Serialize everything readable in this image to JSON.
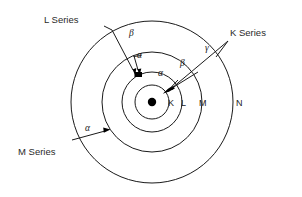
{
  "figure": {
    "background_color": "#ffffff",
    "stroke_color": "#1a1a1a"
  },
  "nucleus": {
    "label": "nucleus",
    "cx": 152,
    "cy": 102,
    "r": 4.2,
    "color": "#000000"
  },
  "shells": [
    {
      "name": "K",
      "label": "K",
      "r": 17,
      "label_x": 168,
      "label_y": 106
    },
    {
      "name": "L",
      "label": "L",
      "r": 30,
      "label_x": 181,
      "label_y": 106
    },
    {
      "name": "M",
      "label": "M",
      "r": 50,
      "label_x": 199,
      "label_y": 106
    },
    {
      "name": "N",
      "label": "N",
      "r": 81,
      "label_x": 236,
      "label_y": 106
    }
  ],
  "series": [
    {
      "id": "k-series",
      "label": "K Series",
      "label_x": 230,
      "label_y": 36,
      "transitions": [
        {
          "greek": "α",
          "greek_x": 158,
          "greek_y": 76
        },
        {
          "greek": "β",
          "greek_x": 180,
          "greek_y": 66
        },
        {
          "greek": "γ",
          "greek_x": 205,
          "greek_y": 51
        }
      ]
    },
    {
      "id": "l-series",
      "label": "L Series",
      "label_x": 44,
      "label_y": 23,
      "transitions": [
        {
          "greek": "α",
          "greek_x": 137,
          "greek_y": 58
        },
        {
          "greek": "β",
          "greek_x": 129,
          "greek_y": 36
        }
      ]
    },
    {
      "id": "m-series",
      "label": "M Series",
      "label_x": 18,
      "label_y": 155,
      "transitions": [
        {
          "greek": "α",
          "greek_x": 85,
          "greek_y": 131
        }
      ]
    }
  ],
  "greek_letters": {
    "alpha": "α",
    "beta": "β",
    "gamma": "γ"
  }
}
